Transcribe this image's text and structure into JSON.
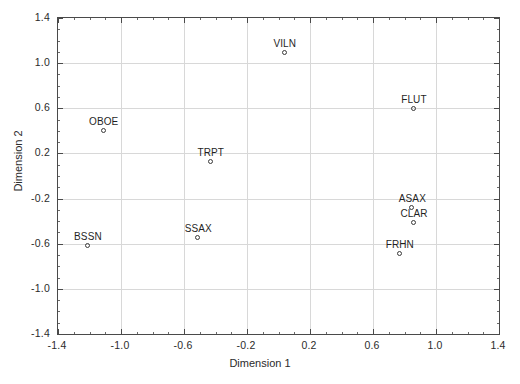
{
  "chart_data": {
    "type": "scatter",
    "title": "",
    "xlabel": "Dimension 1",
    "ylabel": "Dimension 2",
    "xlim": [
      -1.4,
      1.4
    ],
    "ylim": [
      -1.4,
      1.4
    ],
    "xticks": [
      "-1.4",
      "-1.0",
      "-0.6",
      "-0.2",
      "0.2",
      "0.6",
      "1.0",
      "1.4"
    ],
    "xtick_values": [
      -1.4,
      -1.0,
      -0.6,
      -0.2,
      0.2,
      0.6,
      1.0,
      1.4
    ],
    "yticks": [
      "1.4",
      "1.0",
      "0.6",
      "0.2",
      "-0.2",
      "-0.6",
      "-1.0",
      "-1.4"
    ],
    "ytick_values": [
      1.4,
      1.0,
      0.6,
      0.2,
      -0.2,
      -0.6,
      -1.0,
      -1.4
    ],
    "grid": true,
    "legend": "none",
    "marker": "open-circle",
    "marker_color": "#3a3a3a",
    "points": [
      {
        "label": "VILN",
        "x": 0.04,
        "y": 1.09,
        "label_dx": 0,
        "label_dy": -9
      },
      {
        "label": "FLUT",
        "x": 0.86,
        "y": 0.59,
        "label_dx": 0,
        "label_dy": -9
      },
      {
        "label": "OBOE",
        "x": -1.11,
        "y": 0.4,
        "label_dx": 0,
        "label_dy": -9
      },
      {
        "label": "TRPT",
        "x": -0.43,
        "y": 0.12,
        "label_dx": 0,
        "label_dy": -9
      },
      {
        "label": "ASAX",
        "x": 0.85,
        "y": -0.28,
        "label_dx": 0,
        "label_dy": -9
      },
      {
        "label": "CLAR",
        "x": 0.86,
        "y": -0.42,
        "label_dx": 0,
        "label_dy": -9
      },
      {
        "label": "SSAX",
        "x": -0.51,
        "y": -0.55,
        "label_dx": 0,
        "label_dy": -9
      },
      {
        "label": "BSSN",
        "x": -1.21,
        "y": -0.62,
        "label_dx": 0,
        "label_dy": -9
      },
      {
        "label": "FRHN",
        "x": 0.77,
        "y": -0.69,
        "label_dx": 0,
        "label_dy": -9
      }
    ]
  },
  "axes": {
    "frame_color": "#4a4a4a",
    "grid_color": "#d8d8d8"
  }
}
